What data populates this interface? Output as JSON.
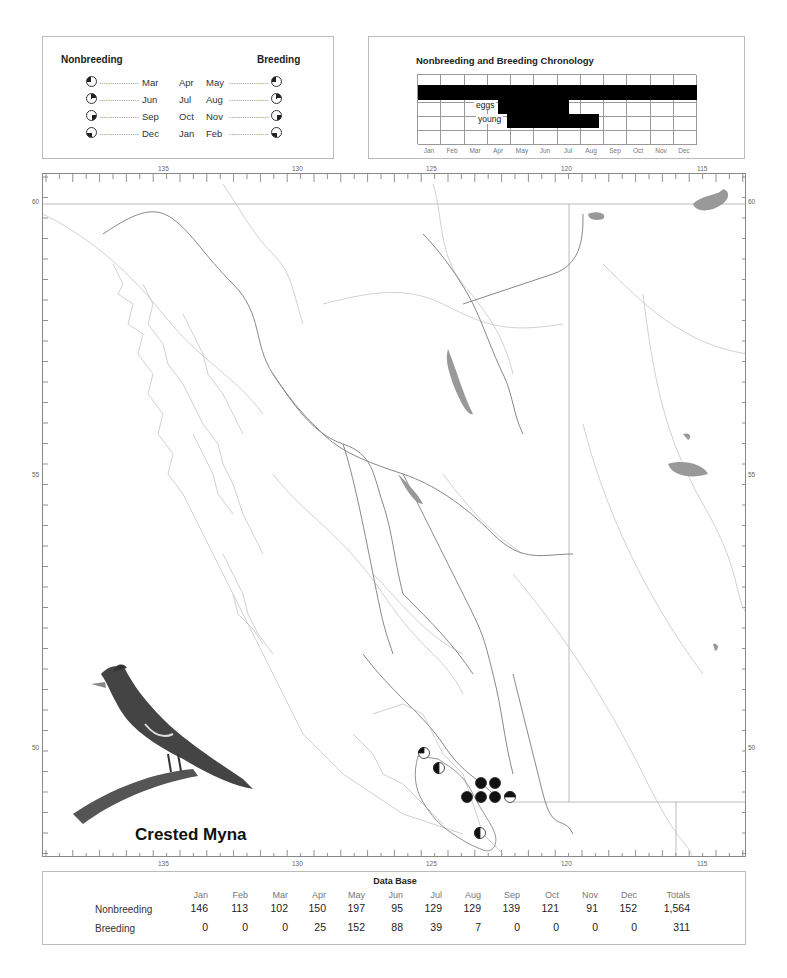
{
  "legend": {
    "nonbreeding_title": "Nonbreeding",
    "breeding_title": "Breeding",
    "rows": [
      {
        "left_month": "Mar",
        "center_month": "Apr",
        "right_month": "May",
        "dots_left": "..................",
        "dots_right": "..................",
        "quadrant": "top-left"
      },
      {
        "left_month": "Jun",
        "center_month": "Jul",
        "right_month": "Aug",
        "dots_left": "..................",
        "dots_right": "..................",
        "quadrant": "top-right"
      },
      {
        "left_month": "Sep",
        "center_month": "Oct",
        "right_month": "Nov",
        "dots_left": "..................",
        "dots_right": "..................",
        "quadrant": "bottom-right"
      },
      {
        "left_month": "Dec",
        "center_month": "Jan",
        "right_month": "Feb",
        "dots_left": "..................",
        "dots_right": "..................",
        "quadrant": "bottom-left"
      }
    ]
  },
  "chronology": {
    "title": "Nonbreeding and Breeding Chronology",
    "months": [
      "Jan",
      "Feb",
      "Mar",
      "Apr",
      "May",
      "Jun",
      "Jul",
      "Aug",
      "Sep",
      "Oct",
      "Nov",
      "Dec"
    ],
    "eggs_label": "eggs",
    "young_label": "young"
  },
  "map": {
    "top_longitudes": [
      "135",
      "130",
      "125",
      "120",
      "115"
    ],
    "bottom_longitudes": [
      "135",
      "130",
      "125",
      "120",
      "115"
    ],
    "left_latitudes": [
      "60",
      "55",
      "50"
    ],
    "right_latitudes": [
      "60",
      "55",
      "50"
    ],
    "species_name": "Crested Myna"
  },
  "database": {
    "title": "Data Base",
    "months": [
      "Jan",
      "Feb",
      "Mar",
      "Apr",
      "May",
      "Jun",
      "Jul",
      "Aug",
      "Sep",
      "Oct",
      "Nov",
      "Dec"
    ],
    "totals_label": "Totals",
    "rows": [
      {
        "label": "Nonbreeding",
        "values": [
          "146",
          "113",
          "102",
          "150",
          "197",
          "95",
          "129",
          "129",
          "139",
          "121",
          "91",
          "152"
        ],
        "total": "1,564"
      },
      {
        "label": "Breeding",
        "values": [
          "0",
          "0",
          "0",
          "25",
          "152",
          "88",
          "39",
          "7",
          "0",
          "0",
          "0",
          "0"
        ],
        "total": "311"
      }
    ]
  },
  "chart_data": [
    {
      "type": "bar",
      "title": "Nonbreeding and Breeding Chronology",
      "categories": [
        "Jan",
        "Feb",
        "Mar",
        "Apr",
        "May",
        "Jun",
        "Jul",
        "Aug",
        "Sep",
        "Oct",
        "Nov",
        "Dec"
      ],
      "series": [
        {
          "name": "nonbreeding",
          "start": "Jan",
          "end": "Dec"
        },
        {
          "name": "eggs",
          "start": "mid Apr",
          "end": "mid Jul"
        },
        {
          "name": "young",
          "start": "late Apr",
          "end": "late Aug"
        }
      ]
    },
    {
      "type": "table",
      "title": "Data Base",
      "categories": [
        "Jan",
        "Feb",
        "Mar",
        "Apr",
        "May",
        "Jun",
        "Jul",
        "Aug",
        "Sep",
        "Oct",
        "Nov",
        "Dec"
      ],
      "series": [
        {
          "name": "Nonbreeding",
          "values": [
            146,
            113,
            102,
            150,
            197,
            95,
            129,
            129,
            139,
            121,
            91,
            152
          ],
          "total": 1564
        },
        {
          "name": "Breeding",
          "values": [
            0,
            0,
            0,
            25,
            152,
            88,
            39,
            7,
            0,
            0,
            0,
            0
          ],
          "total": 311
        }
      ]
    }
  ]
}
